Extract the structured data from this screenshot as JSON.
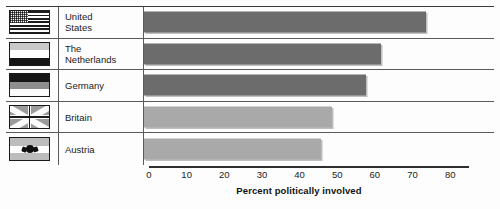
{
  "chart_data": {
    "type": "bar",
    "orientation": "horizontal",
    "title": "",
    "xlabel": "Percent politically involved",
    "ylabel": "",
    "xlim": [
      0,
      85
    ],
    "xticks": [
      0,
      10,
      20,
      30,
      40,
      50,
      60,
      70,
      80
    ],
    "grid": false,
    "legend": "none",
    "categories": [
      "United States",
      "The Netherlands",
      "Germany",
      "Britain",
      "Austria"
    ],
    "values": [
      75,
      63,
      59,
      50,
      47
    ],
    "series": [
      {
        "name": "Percent politically involved",
        "values": [
          75,
          63,
          59,
          50,
          47
        ]
      }
    ]
  },
  "rows": [
    {
      "label_line1": "United",
      "label_line2": "States",
      "label_full": "United States",
      "value": 75,
      "bar_color": "#6c6c6c",
      "flag": "us-flag-icon"
    },
    {
      "label_line1": "The",
      "label_line2": "Netherlands",
      "label_full": "The Netherlands",
      "value": 63,
      "bar_color": "#6c6c6c",
      "flag": "netherlands-flag-icon"
    },
    {
      "label_line1": "Germany",
      "label_line2": "",
      "label_full": "Germany",
      "value": 59,
      "bar_color": "#6c6c6c",
      "flag": "germany-flag-icon"
    },
    {
      "label_line1": "Britain",
      "label_line2": "",
      "label_full": "Britain",
      "value": 50,
      "bar_color": "#a9a9a9",
      "flag": "britain-flag-icon"
    },
    {
      "label_line1": "Austria",
      "label_line2": "",
      "label_full": "Austria",
      "value": 47,
      "bar_color": "#a9a9a9",
      "flag": "austria-flag-icon"
    }
  ],
  "axis": {
    "title": "Percent politically involved",
    "ticks": [
      "0",
      "10",
      "20",
      "30",
      "40",
      "50",
      "60",
      "70",
      "80"
    ]
  },
  "colors": {
    "bar_dark": "#6c6c6c",
    "bar_light": "#a9a9a9",
    "rule": "#5a5a5a",
    "text": "#1b1b1b",
    "background": "#fdfdfd"
  }
}
